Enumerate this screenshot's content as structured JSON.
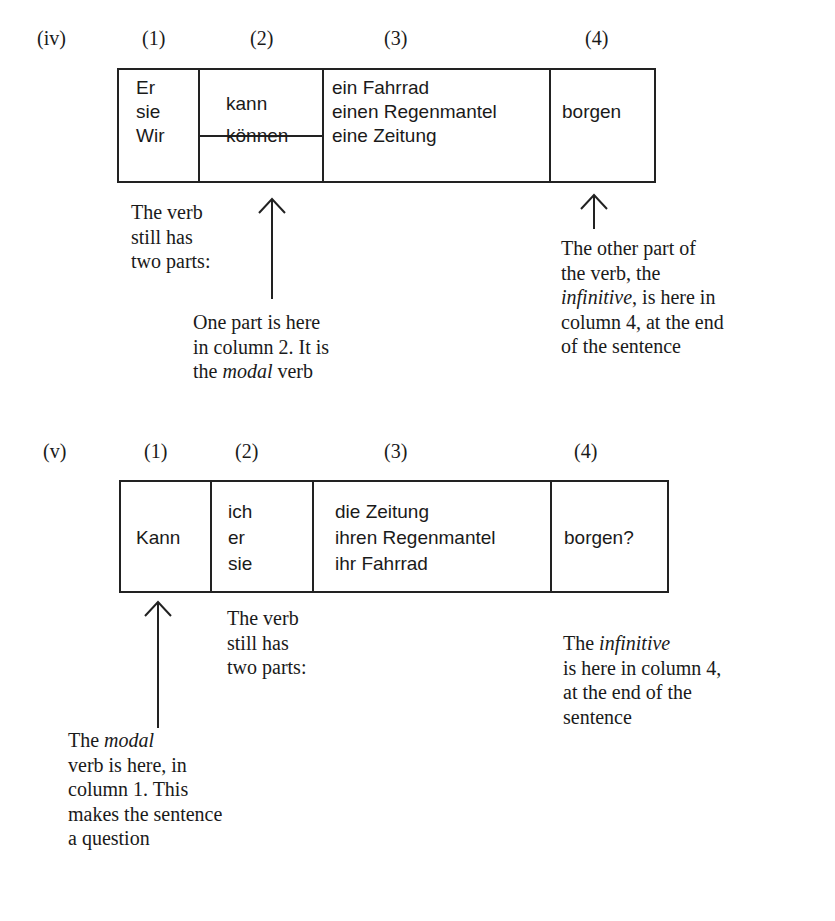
{
  "sections": [
    {
      "id": "iv",
      "label": "(iv)",
      "column_headers": [
        "(1)",
        "(2)",
        "(3)",
        "(4)"
      ],
      "table": {
        "col1": [
          "Er",
          "sie",
          "Wir"
        ],
        "col2_top": "kann",
        "col2_bottom": "können",
        "col3": [
          "ein Fahrrad",
          "einen Regenmantel",
          "eine Zeitung"
        ],
        "col4": "borgen"
      },
      "notes": {
        "left": [
          "The verb",
          "still has",
          "two parts:"
        ],
        "middle": [
          "One part is here",
          "in column 2. It is",
          "the ",
          "modal",
          " verb"
        ],
        "right": [
          "The other part of",
          "the verb, the",
          "infinitive",
          ", is here in",
          "column 4, at the end",
          "of the sentence"
        ]
      }
    },
    {
      "id": "v",
      "label": "(v)",
      "column_headers": [
        "(1)",
        "(2)",
        "(3)",
        "(4)"
      ],
      "table": {
        "col1": "Kann",
        "col2": [
          "ich",
          "er",
          "sie"
        ],
        "col3": [
          "die Zeitung",
          "ihren Regenmantel",
          "ihr Fahrrad"
        ],
        "col4": "borgen?"
      },
      "notes": {
        "middle": [
          "The verb",
          "still has",
          "two parts:"
        ],
        "right": [
          "The ",
          "infinitive",
          "is here in column 4,",
          "at the end of the",
          "sentence"
        ],
        "bottom_left": [
          "The ",
          "modal",
          "verb is here, in",
          "column 1. This",
          "makes the sentence",
          "a question"
        ]
      }
    }
  ]
}
